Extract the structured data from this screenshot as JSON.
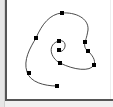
{
  "diagram": {
    "type": "spline-spiral",
    "stroke_color": "#4a4a4a",
    "point_color": "#000000",
    "control_points": [
      {
        "x": 57,
        "y": 86
      },
      {
        "x": 29,
        "y": 73
      },
      {
        "x": 36,
        "y": 38
      },
      {
        "x": 62,
        "y": 13
      },
      {
        "x": 85,
        "y": 42
      },
      {
        "x": 88,
        "y": 51
      },
      {
        "x": 94,
        "y": 65
      },
      {
        "x": 60,
        "y": 63
      },
      {
        "x": 59,
        "y": 41
      },
      {
        "x": 59,
        "y": 50
      }
    ]
  }
}
